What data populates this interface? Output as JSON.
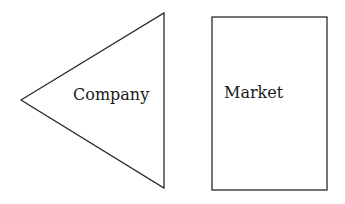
{
  "diagram": {
    "shapes": [
      {
        "id": "company",
        "type": "triangle",
        "label": "Company"
      },
      {
        "id": "market",
        "type": "rectangle",
        "label": "Market"
      }
    ],
    "colors": {
      "stroke": "#2a2a2a",
      "text": "#1a1a1a",
      "background": "#ffffff"
    }
  }
}
